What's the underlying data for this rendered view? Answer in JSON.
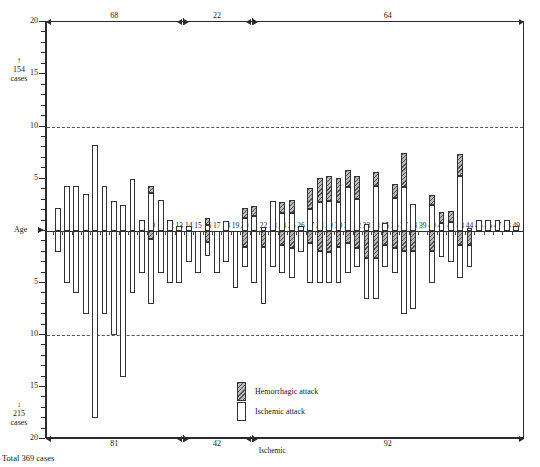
{
  "chart_data": {
    "type": "bar",
    "title": "",
    "xlabel": "Age",
    "ylabel": "",
    "orientation": "vertical-diverging",
    "grid": true,
    "gridlines": [
      10,
      -10
    ],
    "ylim": [
      -20,
      20
    ],
    "y_ticks_major": [
      20,
      15,
      10,
      5,
      0,
      5,
      10,
      15,
      20
    ],
    "x_ticks": [
      "0",
      "1",
      "2",
      "3",
      "4",
      "5",
      "6",
      "7",
      "8",
      "9",
      "10",
      "11",
      "12",
      "13",
      "14",
      "15",
      "16",
      "17",
      "18",
      "19",
      "20",
      "21",
      "22",
      "23",
      "24",
      "25",
      "26",
      "27",
      "28",
      "29",
      "30",
      "31",
      "32",
      "33",
      "34",
      "35",
      "36",
      "37",
      "38",
      "39",
      "40",
      "41",
      "42",
      "43",
      "44",
      "45",
      "46",
      "47",
      "48",
      "49"
    ],
    "legend_position": "inside-bottom-center",
    "series": [
      {
        "name": "Hemorrhagic attack",
        "fill": "hatched-gray",
        "upper_values": [
          0,
          0,
          0,
          0,
          0,
          0,
          0,
          0,
          0,
          0,
          0.7,
          0,
          0,
          0,
          0,
          0,
          0.6,
          0,
          0,
          0,
          1,
          1,
          0,
          0,
          1.1,
          1.3,
          0,
          2,
          2.3,
          2.4,
          2.3,
          1.6,
          2.2,
          0,
          1.3,
          0,
          1.3,
          3.3,
          0,
          0,
          0.9,
          1,
          1,
          2.1,
          0,
          0,
          0,
          0,
          0,
          0
        ],
        "lower_values": [
          0,
          0,
          0,
          0,
          0,
          0,
          0,
          0,
          0,
          0,
          -0.8,
          0,
          0,
          0,
          0,
          0,
          -1.1,
          0,
          0,
          0,
          -1.5,
          0,
          -1.5,
          0,
          -1.3,
          -1.6,
          0,
          -1.2,
          -1.9,
          -2,
          -1.5,
          -1.2,
          -1.6,
          -2.6,
          -2.6,
          -1.3,
          -1.6,
          -1.9,
          -1.9,
          0,
          -1.9,
          0,
          0,
          -1.3,
          -1.3,
          0,
          0,
          0,
          0,
          0
        ]
      },
      {
        "name": "Ischemic attack",
        "fill": "white",
        "upper_values": [
          2.2,
          4.3,
          4.3,
          3.5,
          8.2,
          4.3,
          2.9,
          2.5,
          5,
          1.1,
          3.6,
          3,
          1.1,
          0.5,
          0.5,
          0,
          0.6,
          0,
          1,
          0,
          1.2,
          1.4,
          0.4,
          2.9,
          1.7,
          1.7,
          0.5,
          2.1,
          2.8,
          2.9,
          2.8,
          4.2,
          3.1,
          0.7,
          4.3,
          0.8,
          3.2,
          4.2,
          2.6,
          0,
          2.5,
          0.8,
          0.9,
          5.3,
          0.3,
          1.1,
          1.1,
          1.1,
          1.1,
          0.5
        ],
        "lower_values": [
          -2,
          -5,
          -6,
          -8,
          -18,
          -8,
          -10,
          -14,
          -6,
          -4,
          -7,
          -4,
          -5,
          -5,
          -3,
          -4,
          -2.4,
          -4,
          -3,
          -5.5,
          -3.5,
          -5,
          -7,
          -3.5,
          -4,
          -4.5,
          -2,
          -5,
          -5,
          -5,
          -5,
          -4,
          -3.5,
          -6.5,
          -6.5,
          -3.5,
          -4,
          -8,
          -7.5,
          0,
          -5,
          -2.5,
          -3,
          -4.5,
          -3.5,
          0,
          0,
          0,
          0,
          0
        ]
      }
    ],
    "top_ruler": {
      "segments": [
        "68",
        "22",
        "64"
      ]
    },
    "bottom_ruler": {
      "segments": [
        "81",
        "42",
        "92"
      ],
      "note": "Ischemic"
    },
    "annotations": {
      "upper_total": {
        "arrow": "↑",
        "count": "154",
        "unit": "cases"
      },
      "lower_total": {
        "arrow": "↓",
        "count": "215",
        "unit": "cases"
      },
      "age_axis": "Age",
      "total": "Total  369 cases"
    }
  },
  "chart": {
    "yaxis": {
      "labels": [
        {
          "text": "20",
          "value": 20
        },
        {
          "text": "15",
          "value": 15
        },
        {
          "text": "10",
          "value": 10
        },
        {
          "text": "5",
          "value": 5
        },
        {
          "text": "5",
          "value": -5
        },
        {
          "text": "10",
          "value": -10
        },
        {
          "text": "15",
          "value": -15
        },
        {
          "text": "20",
          "value": -20
        }
      ]
    },
    "legend": {
      "items": [
        {
          "label": "Hemorrhagic attack",
          "swatch": "hem"
        },
        {
          "label": "Ischemic attack",
          "swatch": "isch"
        }
      ]
    },
    "upper_note": {
      "arrow": "↑",
      "count": "154",
      "unit": "cases"
    },
    "lower_note": {
      "arrow": "↓",
      "count": "215",
      "unit": "cases"
    },
    "age_label": "Age",
    "total_label": "Total  369 cases",
    "ischemic_bottom_label": "Ischemic",
    "top_segments": [
      "68",
      "22",
      "64"
    ],
    "bottom_segments": [
      "81",
      "42",
      "92"
    ]
  }
}
